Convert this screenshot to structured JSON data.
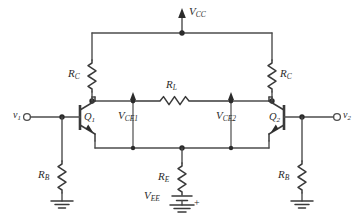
{
  "diagram": {
    "type": "schematic",
    "background_color": "#ffffff",
    "wire_color": "#4d4d4d",
    "label_color": "#2b2b2b"
  },
  "supplies": {
    "vcc": {
      "symbol": "V",
      "subscript": "CC",
      "arrow": "up"
    },
    "vee": {
      "symbol": "V",
      "subscript": "EE",
      "polarity": "+"
    }
  },
  "inputs": {
    "left": {
      "symbol": "v",
      "subscript": "1"
    },
    "right": {
      "symbol": "v",
      "subscript": "2"
    }
  },
  "transistors": [
    {
      "symbol": "Q",
      "subscript": "1",
      "type": "npn",
      "side": "left"
    },
    {
      "symbol": "Q",
      "subscript": "2",
      "type": "npn",
      "side": "right"
    }
  ],
  "resistors": [
    {
      "symbol": "R",
      "subscript": "C",
      "side": "left",
      "orientation": "vertical"
    },
    {
      "symbol": "R",
      "subscript": "C",
      "side": "right",
      "orientation": "vertical"
    },
    {
      "symbol": "R",
      "subscript": "L",
      "side": "center",
      "orientation": "horizontal"
    },
    {
      "symbol": "R",
      "subscript": "E",
      "side": "center",
      "orientation": "vertical"
    },
    {
      "symbol": "R",
      "subscript": "B",
      "side": "left",
      "orientation": "vertical"
    },
    {
      "symbol": "R",
      "subscript": "B",
      "side": "right",
      "orientation": "vertical"
    }
  ],
  "voltage_markers": [
    {
      "symbol": "V",
      "subscript": "CE1",
      "arrow": "up",
      "side": "left"
    },
    {
      "symbol": "V",
      "subscript": "CE2",
      "arrow": "up",
      "side": "right"
    }
  ],
  "grounds": [
    {
      "side": "left"
    },
    {
      "side": "center"
    },
    {
      "side": "right"
    }
  ],
  "labels": {
    "vcc_main": "V",
    "vcc_sub": "CC",
    "vee_main": "V",
    "vee_sub": "EE",
    "vee_plus": "+",
    "v1_main": "v",
    "v1_sub": "1",
    "v2_main": "v",
    "v2_sub": "2",
    "q1_main": "Q",
    "q1_sub": "1",
    "q2_main": "Q",
    "q2_sub": "2",
    "rc_left_main": "R",
    "rc_left_sub": "C",
    "rc_right_main": "R",
    "rc_right_sub": "C",
    "rl_main": "R",
    "rl_sub": "L",
    "re_main": "R",
    "re_sub": "E",
    "rb_left_main": "R",
    "rb_left_sub": "B",
    "rb_right_main": "R",
    "rb_right_sub": "B",
    "vce1_main": "V",
    "vce1_sub": "CE1",
    "vce2_main": "V",
    "vce2_sub": "CE2"
  }
}
